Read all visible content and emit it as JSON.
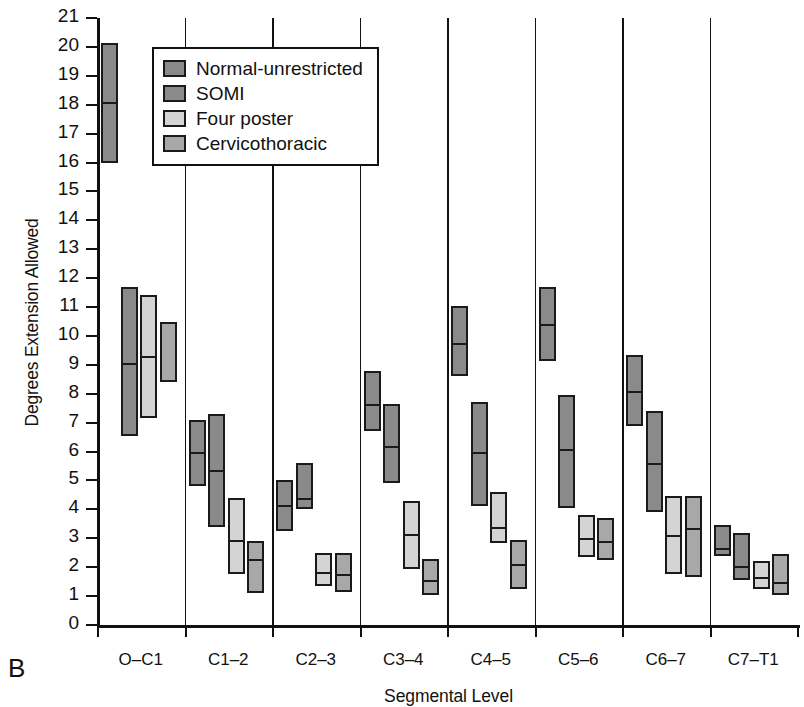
{
  "panel_label": "B",
  "legend": {
    "items": [
      {
        "label": "Normal-unrestricted",
        "color": "#8a8a8a"
      },
      {
        "label": "SOMI",
        "color": "#8a8a8a"
      },
      {
        "label": "Four poster",
        "color": "#d4d4d4"
      },
      {
        "label": "Cervicothoracic",
        "color": "#a8a8a8"
      }
    ]
  },
  "chart_data": {
    "type": "bar",
    "title": "",
    "subtitle": "",
    "xlabel": "Segmental Level",
    "ylabel": "Degrees Extension Allowed",
    "ylim": [
      0,
      21
    ],
    "ytick_step": 1,
    "yticks": [
      21,
      20,
      19,
      18,
      17,
      16,
      15,
      14,
      13,
      12,
      11,
      10,
      9,
      8,
      7,
      6,
      5,
      4,
      3,
      2,
      1,
      0
    ],
    "grid": false,
    "legend_position": "upper-left-inside",
    "categories": [
      "O–C1",
      "C1–2",
      "C2–3",
      "C3–4",
      "C4–5",
      "C5–6",
      "C6–7",
      "C7–T1"
    ],
    "series": [
      {
        "name": "Normal-unrestricted",
        "color": "#8a8a8a",
        "low": [
          16.0,
          4.8,
          3.25,
          6.7,
          8.6,
          9.15,
          6.9,
          2.4
        ],
        "median": [
          18.1,
          6.0,
          4.15,
          7.65,
          9.75,
          10.4,
          8.1,
          2.65
        ],
        "high": [
          20.15,
          7.1,
          5.0,
          8.8,
          11.05,
          11.7,
          9.35,
          3.45
        ]
      },
      {
        "name": "SOMI",
        "color": "#8a8a8a",
        "low": [
          6.55,
          3.4,
          4.0,
          4.9,
          4.1,
          4.05,
          3.9,
          1.55
        ],
        "median": [
          9.05,
          5.35,
          4.4,
          6.2,
          6.0,
          6.1,
          5.6,
          2.05
        ],
        "high": [
          11.7,
          7.3,
          5.6,
          7.65,
          7.7,
          7.95,
          7.4,
          3.2
        ]
      },
      {
        "name": "Four poster",
        "color": "#d4d4d4",
        "low": [
          7.15,
          1.75,
          1.35,
          1.95,
          2.85,
          2.35,
          1.75,
          1.25
        ],
        "median": [
          9.3,
          2.95,
          1.85,
          3.15,
          3.4,
          3.0,
          3.1,
          1.65
        ],
        "high": [
          11.4,
          4.4,
          2.5,
          4.3,
          4.6,
          3.8,
          4.45,
          2.2
        ]
      },
      {
        "name": "Cervicothoracic",
        "color": "#a8a8a8",
        "low": [
          8.4,
          1.1,
          1.15,
          1.05,
          1.25,
          2.25,
          1.65,
          1.05
        ],
        "median": [
          null,
          2.3,
          1.75,
          1.55,
          2.1,
          2.9,
          3.35,
          1.5
        ],
        "high": [
          10.5,
          2.9,
          2.5,
          2.3,
          2.95,
          3.7,
          4.45,
          2.45
        ]
      }
    ]
  }
}
